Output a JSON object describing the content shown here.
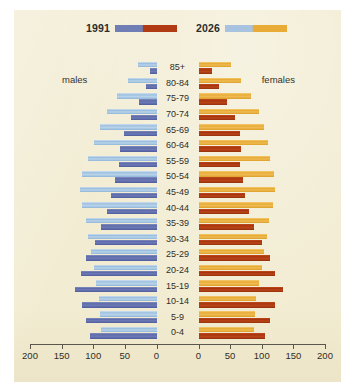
{
  "legend": {
    "series": [
      {
        "label": "1991",
        "swatch": "blue-darkred-bar"
      },
      {
        "label": "2026",
        "swatch": "lightblue-yellow-bar"
      }
    ]
  },
  "labels": {
    "males": "males",
    "females": "females"
  },
  "axis": {
    "left_ticks": [
      "200",
      "150",
      "100",
      "50",
      "0"
    ],
    "right_ticks": [
      "0",
      "50",
      "100",
      "150",
      "200"
    ]
  },
  "chart_data": {
    "type": "bar",
    "subtype": "population-pyramid",
    "title": "",
    "xlabel": "",
    "ylabel": "",
    "xlim": [
      0,
      200
    ],
    "grid": false,
    "legend_position": "top",
    "categories": [
      "85+",
      "80-84",
      "75-79",
      "70-74",
      "65-69",
      "60-64",
      "55-59",
      "50-54",
      "45-49",
      "40-44",
      "35-39",
      "30-34",
      "25-29",
      "20-24",
      "15-19",
      "10-14",
      "5-9",
      "0-4"
    ],
    "series": [
      {
        "name": "1991 males",
        "side": "left",
        "color": "#5d6bab",
        "values": [
          10,
          17,
          28,
          40,
          52,
          58,
          60,
          66,
          72,
          78,
          88,
          98,
          112,
          120,
          130,
          118,
          112,
          105
        ]
      },
      {
        "name": "2026 males",
        "side": "left",
        "color": "#9dbfdf",
        "values": [
          30,
          45,
          62,
          78,
          90,
          100,
          108,
          118,
          122,
          118,
          112,
          108,
          104,
          100,
          96,
          92,
          90,
          88
        ]
      },
      {
        "name": "1991 females",
        "side": "right",
        "color": "#a8350f",
        "values": [
          22,
          32,
          46,
          58,
          66,
          68,
          66,
          70,
          74,
          80,
          88,
          100,
          114,
          122,
          134,
          122,
          114,
          106
        ]
      },
      {
        "name": "2026 females",
        "side": "right",
        "color": "#e8ab35",
        "values": [
          52,
          68,
          84,
          96,
          104,
          110,
          114,
          120,
          122,
          118,
          112,
          108,
          104,
          100,
          96,
          92,
          90,
          88
        ]
      }
    ]
  }
}
